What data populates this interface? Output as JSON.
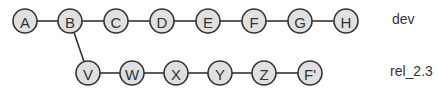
{
  "branches": [
    {
      "name": "dev",
      "label_pos": {
        "x": 392,
        "y": 11
      },
      "commits": [
        {
          "id": "A",
          "x": 25,
          "y": 21
        },
        {
          "id": "B",
          "x": 70,
          "y": 21
        },
        {
          "id": "C",
          "x": 116,
          "y": 21
        },
        {
          "id": "D",
          "x": 162,
          "y": 21
        },
        {
          "id": "E",
          "x": 208,
          "y": 21
        },
        {
          "id": "F",
          "x": 254,
          "y": 21
        },
        {
          "id": "G",
          "x": 300,
          "y": 21
        },
        {
          "id": "H",
          "x": 346,
          "y": 21
        }
      ]
    },
    {
      "name": "rel_2.3",
      "label_pos": {
        "x": 390,
        "y": 63
      },
      "parent": "B",
      "commits": [
        {
          "id": "V",
          "x": 88,
          "y": 73
        },
        {
          "id": "W",
          "x": 132,
          "y": 73
        },
        {
          "id": "X",
          "x": 176,
          "y": 73
        },
        {
          "id": "Y",
          "x": 220,
          "y": 73
        },
        {
          "id": "Z",
          "x": 264,
          "y": 73
        },
        {
          "id": "F'",
          "x": 310,
          "y": 73
        }
      ]
    }
  ],
  "node_radius": 12,
  "colors": {
    "node_fill": "#e0e0e0",
    "stroke": "#333333",
    "text": "#333333"
  }
}
